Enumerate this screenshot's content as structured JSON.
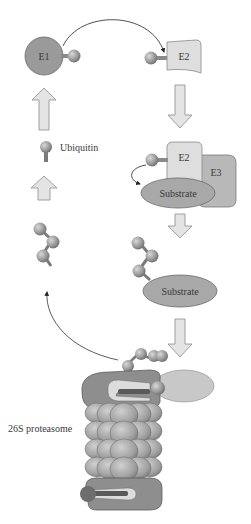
{
  "diagram": {
    "nodes": {
      "e1": "E1",
      "e2_top": "E2",
      "e2_complex": "E2",
      "e3": "E3",
      "substrate_1": "Substrate",
      "substrate_2": "Substrate",
      "ubiquitin": "Ubiquitin",
      "proteasome": "26S proteasome"
    },
    "colors": {
      "e1_fill": "#9a9a9a",
      "e2_fill": "#dedede",
      "e3_fill": "#b8b8b8",
      "substrate_fill": "#a8a8a8",
      "arrow_fill": "#e4e4e4",
      "arrow_stroke": "#8a8a8a",
      "ubiquitin_fill": "#9c9c9c",
      "proteasome_cap": "#8e8e8e",
      "proteasome_core": "#a6a6a6",
      "text": "#3a3a3a"
    }
  }
}
